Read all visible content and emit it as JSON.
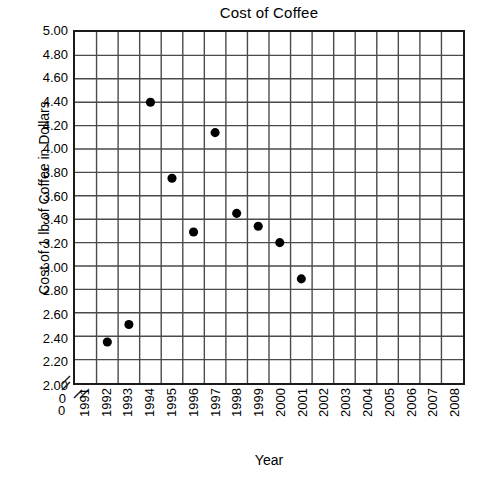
{
  "chart_data": {
    "type": "scatter",
    "title": "Cost of Coffee",
    "xlabel": "Year",
    "ylabel": "Cost of 1 lb of Coffee in Dollars",
    "xlim": [
      1990.5,
      2008.5
    ],
    "ylim": [
      2.0,
      5.0
    ],
    "y_axis_break": true,
    "x_axis_break": true,
    "grid": true,
    "legend": "none",
    "marker": "filled-circle",
    "marker_color": "#000000",
    "x_tick_labels": [
      "1991",
      "1992",
      "1993",
      "1994",
      "1995",
      "1996",
      "1997",
      "1998",
      "1999",
      "2000",
      "2001",
      "2002",
      "2003",
      "2004",
      "2005",
      "2006",
      "2007",
      "2008"
    ],
    "y_tick_labels": [
      "5.00",
      "4.80",
      "4.60",
      "4.40",
      "4.20",
      "4.00",
      "3.80",
      "3.60",
      "3.40",
      "3.20",
      "3.00",
      "2.80",
      "2.60",
      "2.40",
      "2.20",
      "2.00"
    ],
    "y_tick_values": [
      5.0,
      4.8,
      4.6,
      4.4,
      4.2,
      4.0,
      3.8,
      3.6,
      3.4,
      3.2,
      3.0,
      2.8,
      2.6,
      2.4,
      2.2,
      2.0
    ],
    "origin_label": "0",
    "x": [
      1992,
      1993,
      1994,
      1995,
      1996,
      1997,
      1998,
      1999,
      2000,
      2001
    ],
    "values": [
      2.35,
      2.5,
      4.4,
      3.75,
      3.29,
      4.14,
      3.45,
      3.34,
      3.2,
      2.89
    ],
    "points": [
      {
        "year": "1992",
        "cost": 2.35
      },
      {
        "year": "1993",
        "cost": 2.5
      },
      {
        "year": "1994",
        "cost": 4.4
      },
      {
        "year": "1995",
        "cost": 3.75
      },
      {
        "year": "1996",
        "cost": 3.29
      },
      {
        "year": "1997",
        "cost": 4.14
      },
      {
        "year": "1998",
        "cost": 3.45
      },
      {
        "year": "1999",
        "cost": 3.34
      },
      {
        "year": "2000",
        "cost": 3.2
      },
      {
        "year": "2001",
        "cost": 2.89
      }
    ],
    "colors": {
      "frame": "#1b1b1b",
      "grid": "#4a4a4a",
      "marker": "#000000",
      "background": "#ffffff",
      "text": "#000000"
    }
  }
}
